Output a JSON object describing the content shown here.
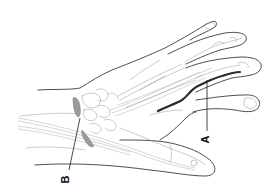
{
  "diagram": {
    "labels": [
      {
        "id": "A",
        "text": "A",
        "orientation": "rotated-90",
        "points_to": "dark nerve/vessel along middle finger"
      },
      {
        "id": "B",
        "text": "B",
        "orientation": "rotated-90",
        "points_to": "shaded ligament at wrist"
      }
    ],
    "colors": {
      "background": "#ffffff",
      "outline": "#3a3a3a",
      "detail": "#8a8a8a",
      "highlight_structure": "#2a2a2a",
      "ligament_fill": "#9b9b9b"
    }
  }
}
